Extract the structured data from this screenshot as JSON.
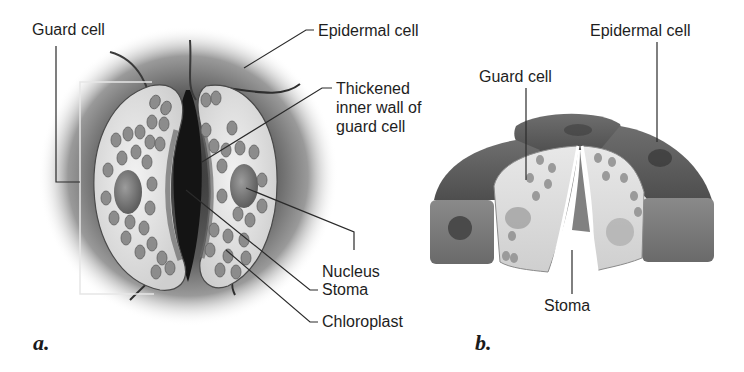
{
  "figure": {
    "panels": [
      {
        "id": "a",
        "letter": "a.",
        "view": "surface view",
        "labels": {
          "guard_cell": "Guard cell",
          "epidermal_cell": "Epidermal cell",
          "thickened_wall": "Thickened\ninner wall of\nguard cell",
          "nucleus": "Nucleus",
          "stoma": "Stoma",
          "chloroplast": "Chloroplast"
        }
      },
      {
        "id": "b",
        "letter": "b.",
        "view": "cutaway 3D view",
        "labels": {
          "epidermal_cell": "Epidermal cell",
          "guard_cell": "Guard cell",
          "stoma": "Stoma"
        }
      }
    ],
    "colors": {
      "background": "#ffffff",
      "label_text": "#1e1e1e",
      "leader_line": "#2a2a2a",
      "guard_cell_fill": "#e4e4e4",
      "chloroplast_fill": "#8a8a8a",
      "epidermis_dark": "#5a5a5a",
      "epidermis_mid": "#7c7c7c"
    }
  }
}
